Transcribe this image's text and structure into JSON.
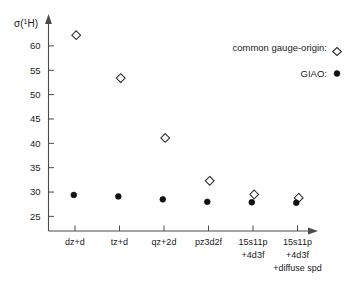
{
  "chart_data": {
    "type": "scatter",
    "title": "",
    "xlabel": "",
    "ylabel": "σ(¹H)",
    "ylabel_base": "σ(",
    "ylabel_sup": "1",
    "ylabel_tail": "H)",
    "ylim": [
      22.0,
      64.5
    ],
    "yticks": [
      25,
      30,
      35,
      40,
      45,
      50,
      55,
      60
    ],
    "ytick_labels": [
      "25",
      "30",
      "35",
      "40",
      "45",
      "50",
      "55",
      "60"
    ],
    "grid": false,
    "legend_position": "top-right",
    "categories": [
      "dz+d",
      "tz+d",
      "qz+2d",
      "pz3d2f",
      "15s11p\n+4d3f",
      "15s11p\n+4d3f\n+diffuse spd"
    ],
    "category_lines": [
      [
        "dz+d"
      ],
      [
        "tz+d"
      ],
      [
        "qz+2d"
      ],
      [
        "pz3d2f"
      ],
      [
        "15s11p",
        "+4d3f"
      ],
      [
        "15s11p",
        "+4d3f",
        "+diffuse spd"
      ]
    ],
    "series": [
      {
        "name": "common gauge-origin:",
        "marker": "open-diamond",
        "color": "#2b2b2b",
        "values": [
          62.2,
          53.4,
          41.1,
          32.3,
          29.5,
          28.8
        ]
      },
      {
        "name": "GIAO:",
        "marker": "filled-circle",
        "color": "#101010",
        "values": [
          29.4,
          29.1,
          28.5,
          28.0,
          27.9,
          27.8
        ]
      }
    ]
  },
  "legend": {
    "entries": [
      {
        "label": "common gauge-origin:",
        "marker": "open-diamond"
      },
      {
        "label": "GIAO:",
        "marker": "filled-circle"
      }
    ]
  }
}
